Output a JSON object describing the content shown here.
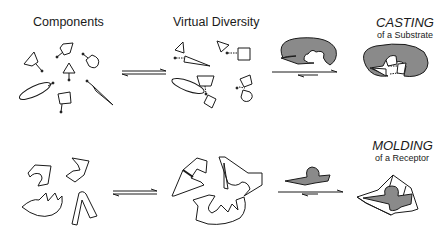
{
  "headings": {
    "components": "Components",
    "virtual_diversity": "Virtual Diversity",
    "casting": "CASTING",
    "casting_sub": "of a Substrate",
    "molding": "MOLDING",
    "molding_sub": "of a Receptor"
  },
  "colors": {
    "stroke": "#1a1a1a",
    "fill_gray": "#8a8a8a",
    "background": "#ffffff"
  },
  "rows": [
    {
      "name": "casting",
      "stages": [
        "Components",
        "Virtual Diversity",
        "Receptor binding",
        "CASTING of a Substrate"
      ]
    },
    {
      "name": "molding",
      "stages": [
        "Components",
        "Virtual Diversity",
        "Substrate binding",
        "MOLDING of a Receptor"
      ]
    }
  ],
  "arrows": [
    "equilibrium",
    "equilibrium",
    "equilibrium",
    "equilibrium"
  ]
}
